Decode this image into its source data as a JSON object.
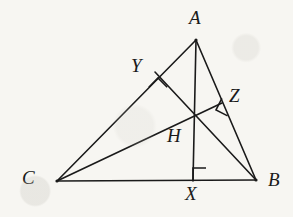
{
  "figure": {
    "kind": "geometry-diagram",
    "background_color": "#f7f6f2",
    "stroke_color": "#1a1a1a",
    "label_color": "#1a1a1a",
    "stroke_width": 1.6,
    "width": 293,
    "height": 217
  },
  "points": [
    {
      "id": "A",
      "label": "A",
      "x": 196,
      "y": 40,
      "label_x": 189,
      "label_y": 8,
      "role": "triangle-vertex"
    },
    {
      "id": "C",
      "label": "C",
      "x": 57,
      "y": 181,
      "label_x": 22,
      "label_y": 168,
      "role": "triangle-vertex"
    },
    {
      "id": "B",
      "label": "B",
      "x": 256,
      "y": 180,
      "label_x": 268,
      "label_y": 170,
      "role": "triangle-vertex"
    },
    {
      "id": "Y",
      "label": "Y",
      "x": 155,
      "y": 72,
      "label_x": 131,
      "label_y": 56,
      "role": "altitude-foot-on-CA"
    },
    {
      "id": "Z",
      "label": "Z",
      "x": 222,
      "y": 103,
      "label_x": 229,
      "label_y": 86,
      "role": "altitude-foot-on-AB"
    },
    {
      "id": "X",
      "label": "X",
      "x": 193,
      "y": 181,
      "label_x": 185,
      "label_y": 184,
      "role": "altitude-foot-on-CB"
    },
    {
      "id": "H",
      "label": "H",
      "x": 192,
      "y": 115,
      "label_x": 167,
      "label_y": 126,
      "role": "orthocenter"
    }
  ],
  "segments": [
    {
      "id": "CA",
      "from": "C",
      "to": "A",
      "name": "side-ca"
    },
    {
      "id": "AB",
      "from": "A",
      "to": "B",
      "name": "side-ab"
    },
    {
      "id": "CB",
      "from": "C",
      "to": "B",
      "name": "side-cb"
    },
    {
      "id": "AX",
      "from": "A",
      "to": "X",
      "name": "altitude-ax"
    },
    {
      "id": "BY",
      "from": "B",
      "to": "Y",
      "name": "altitude-by"
    },
    {
      "id": "CZ",
      "from": "C",
      "to": "Z",
      "name": "altitude-cz"
    }
  ],
  "right_angles": [
    {
      "id": "angle-at-X",
      "at": "X",
      "size": 13,
      "rotation": 0,
      "offset_x": 0,
      "offset_y": -13,
      "note": "AX perpendicular to CB"
    },
    {
      "id": "angle-at-Y",
      "at": "Y",
      "size": 13,
      "rotation": 45,
      "offset_x": 3,
      "offset_y": 6,
      "note": "BY perpendicular to CA"
    },
    {
      "id": "angle-at-Z",
      "at": "Z",
      "size": 13,
      "rotation": -63,
      "offset_x": -6,
      "offset_y": 7,
      "note": "CZ perpendicular to AB"
    }
  ]
}
